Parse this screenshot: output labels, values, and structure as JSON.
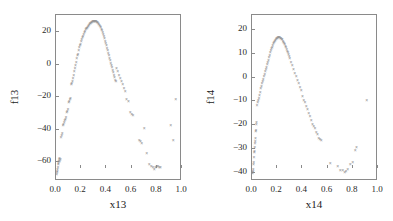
{
  "figure": {
    "background": "#ffffff",
    "marker_color": "#8f8f8f",
    "axis_color": "#8a8a8a",
    "marker_symbol": "×"
  },
  "chart_data": [
    {
      "type": "scatter",
      "title": "",
      "xlabel": "x13",
      "ylabel": "f13",
      "xlim": [
        0.0,
        1.0
      ],
      "ylim": [
        -72,
        30
      ],
      "grid": false,
      "legend": "none",
      "xticks": [
        "0.0",
        "0.2",
        "0.4",
        "0.6",
        "0.8",
        "1.0"
      ],
      "xtickvalues": [
        0.0,
        0.2,
        0.4,
        0.6,
        0.8,
        1.0
      ],
      "yticks": [
        "20",
        "0",
        "-20",
        "-40",
        "-60"
      ],
      "ytickvalues": [
        20,
        0,
        -20,
        -40,
        -60
      ],
      "x": [
        0.005,
        0.008,
        0.01,
        0.012,
        0.015,
        0.018,
        0.02,
        0.022,
        0.025,
        0.028,
        0.03,
        0.035,
        0.04,
        0.045,
        0.05,
        0.055,
        0.06,
        0.065,
        0.07,
        0.075,
        0.08,
        0.085,
        0.09,
        0.095,
        0.1,
        0.105,
        0.11,
        0.115,
        0.12,
        0.125,
        0.13,
        0.135,
        0.14,
        0.145,
        0.15,
        0.155,
        0.16,
        0.165,
        0.17,
        0.175,
        0.18,
        0.185,
        0.19,
        0.195,
        0.2,
        0.205,
        0.21,
        0.215,
        0.22,
        0.225,
        0.23,
        0.235,
        0.24,
        0.245,
        0.25,
        0.255,
        0.26,
        0.265,
        0.27,
        0.275,
        0.28,
        0.285,
        0.29,
        0.295,
        0.3,
        0.305,
        0.31,
        0.315,
        0.32,
        0.325,
        0.33,
        0.335,
        0.34,
        0.345,
        0.35,
        0.355,
        0.36,
        0.365,
        0.37,
        0.375,
        0.38,
        0.385,
        0.39,
        0.395,
        0.4,
        0.405,
        0.41,
        0.415,
        0.42,
        0.425,
        0.43,
        0.435,
        0.44,
        0.445,
        0.45,
        0.455,
        0.46,
        0.465,
        0.47,
        0.475,
        0.48,
        0.49,
        0.5,
        0.51,
        0.52,
        0.53,
        0.54,
        0.55,
        0.56,
        0.575,
        0.59,
        0.6,
        0.61,
        0.66,
        0.67,
        0.68,
        0.7,
        0.72,
        0.74,
        0.755,
        0.77,
        0.78,
        0.79,
        0.8,
        0.81,
        0.82,
        0.83,
        0.91,
        0.93,
        0.95,
        0.995
      ],
      "y": [
        -68,
        -67,
        -66,
        -65,
        -64,
        -62,
        -61,
        -60,
        -59,
        -58,
        -60,
        -59,
        -45,
        -44,
        -43,
        -38,
        -37,
        -36,
        -35,
        -34,
        -33,
        -30,
        -29,
        -28,
        -24,
        -23,
        -22,
        -21,
        -13,
        -12,
        -11,
        -9,
        -7,
        -5,
        -3,
        -1,
        1,
        3,
        5,
        6,
        8,
        10,
        11,
        12,
        14,
        15,
        16,
        17,
        18,
        19,
        20,
        21,
        21.5,
        22,
        22.5,
        23,
        23.5,
        24,
        24.5,
        25,
        25.2,
        25.5,
        25.7,
        25.9,
        26,
        26,
        26,
        26,
        25.8,
        25.5,
        25.2,
        24.8,
        24.3,
        23.8,
        23,
        22.2,
        21.3,
        20.3,
        19.2,
        18,
        16.8,
        15.5,
        14,
        12.5,
        11,
        9.5,
        8,
        6.5,
        5,
        3.5,
        2,
        0.5,
        -1,
        -2.5,
        -4,
        -5.5,
        -7,
        -8.5,
        -10,
        -11,
        -3,
        -5,
        -7,
        -9,
        -11,
        -13,
        -15,
        -17,
        -22,
        -23,
        -30,
        -31,
        -32,
        -47,
        -48,
        -49,
        -40,
        -55,
        -62,
        -63,
        -64,
        -65,
        -64,
        -63,
        -63,
        -64,
        -64,
        -38,
        -47,
        -22,
        -4
      ]
    },
    {
      "type": "scatter",
      "title": "",
      "xlabel": "x14",
      "ylabel": "f14",
      "xlim": [
        0.0,
        1.0
      ],
      "ylim": [
        -44,
        26
      ],
      "grid": false,
      "legend": "none",
      "xticks": [
        "0.0",
        "0.2",
        "0.4",
        "0.6",
        "0.8",
        "1.0"
      ],
      "xtickvalues": [
        0.0,
        0.2,
        0.4,
        0.6,
        0.8,
        1.0
      ],
      "yticks": [
        "20",
        "10",
        "0",
        "-10",
        "-20",
        "-30",
        "-40"
      ],
      "ytickvalues": [
        20,
        10,
        0,
        -10,
        -20,
        -30,
        -40
      ],
      "x": [
        0.004,
        0.006,
        0.008,
        0.01,
        0.012,
        0.014,
        0.016,
        0.018,
        0.02,
        0.022,
        0.024,
        0.026,
        0.028,
        0.03,
        0.032,
        0.034,
        0.036,
        0.04,
        0.045,
        0.05,
        0.055,
        0.06,
        0.065,
        0.07,
        0.075,
        0.08,
        0.085,
        0.09,
        0.095,
        0.1,
        0.105,
        0.11,
        0.115,
        0.12,
        0.125,
        0.13,
        0.135,
        0.14,
        0.145,
        0.15,
        0.155,
        0.16,
        0.165,
        0.17,
        0.175,
        0.18,
        0.185,
        0.19,
        0.195,
        0.2,
        0.205,
        0.21,
        0.215,
        0.22,
        0.225,
        0.23,
        0.235,
        0.24,
        0.245,
        0.25,
        0.255,
        0.26,
        0.265,
        0.27,
        0.275,
        0.28,
        0.285,
        0.29,
        0.295,
        0.3,
        0.31,
        0.32,
        0.33,
        0.34,
        0.35,
        0.36,
        0.37,
        0.38,
        0.39,
        0.4,
        0.41,
        0.42,
        0.43,
        0.44,
        0.45,
        0.46,
        0.47,
        0.48,
        0.49,
        0.5,
        0.51,
        0.52,
        0.53,
        0.54,
        0.55,
        0.62,
        0.68,
        0.7,
        0.72,
        0.735,
        0.745,
        0.76,
        0.78,
        0.8,
        0.82,
        0.83,
        0.91,
        1.0
      ],
      "y": [
        -41,
        -40.5,
        -40,
        -39,
        -37,
        -36,
        -34,
        -32,
        -31.5,
        -30,
        -28,
        -27.5,
        -26,
        -23,
        -22.5,
        -20,
        -19.5,
        -12,
        -11,
        -10,
        -9,
        -8,
        -6.5,
        -5,
        -4,
        -3,
        -2,
        -1,
        0,
        1,
        2,
        3,
        4,
        5,
        6,
        7,
        8,
        9,
        10,
        11,
        11.8,
        12.5,
        13.2,
        13.8,
        14.3,
        14.8,
        15.3,
        15.7,
        16,
        16.2,
        16.4,
        16.5,
        16.5,
        16.4,
        16.3,
        16.1,
        15.8,
        15.5,
        15,
        14.5,
        14,
        13.4,
        12.8,
        12.2,
        11.5,
        10.8,
        10,
        9.2,
        8.4,
        7.5,
        6,
        4.5,
        3,
        1.5,
        0,
        -1.5,
        -3,
        -4.5,
        -6,
        -8.5,
        -10,
        -11,
        -12.5,
        -14,
        -15.5,
        -17,
        -18.5,
        -20,
        -21,
        -22,
        -23.5,
        -24.5,
        -26,
        -26.5,
        -27,
        -36.5,
        -38,
        -39.5,
        -39.5,
        -40.5,
        -40,
        -39,
        -37,
        -36,
        -31,
        -30,
        -10,
        23
      ]
    }
  ]
}
